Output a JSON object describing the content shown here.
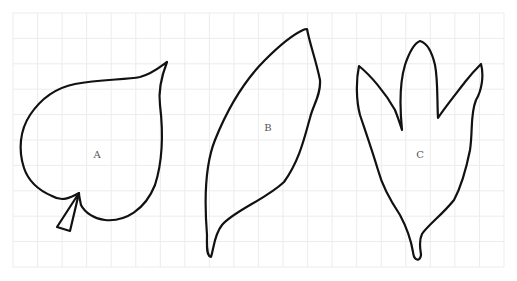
{
  "diagram": {
    "grid": {
      "x0": 13,
      "y0": 13,
      "x1": 504,
      "y1": 267,
      "cols": 20,
      "rows": 10,
      "color": "#ececec"
    },
    "stroke_color": "#111111",
    "leaves": [
      {
        "id": "A",
        "label": "A",
        "label_pos": [
          97,
          158
        ]
      },
      {
        "id": "B",
        "label": "B",
        "label_pos": [
          268,
          131
        ]
      },
      {
        "id": "C",
        "label": "C",
        "label_pos": [
          420,
          158
        ]
      }
    ]
  }
}
